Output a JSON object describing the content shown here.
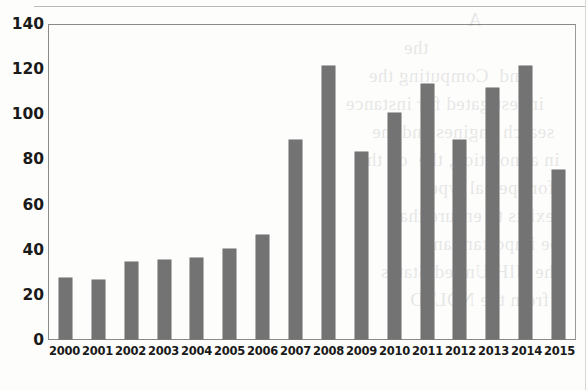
{
  "chart_data": {
    "type": "bar",
    "title": "",
    "xlabel": "",
    "ylabel": "",
    "categories": [
      "2000",
      "2001",
      "2002",
      "2003",
      "2004",
      "2005",
      "2006",
      "2007",
      "2008",
      "2009",
      "2010",
      "2011",
      "2012",
      "2013",
      "2014",
      "2015"
    ],
    "values": [
      27,
      26,
      34,
      35,
      36,
      40,
      46,
      88,
      121,
      83,
      100,
      113,
      88,
      111,
      121,
      75
    ],
    "ylim": [
      0,
      140
    ],
    "yticks": [
      0,
      20,
      40,
      60,
      80,
      100,
      120,
      140
    ],
    "ytick_labels": [
      "0",
      "20",
      "40",
      "60",
      "80",
      "100",
      "120",
      "140"
    ],
    "grid": false,
    "legend": null,
    "bar_color": "#737373",
    "axis_color": "#8a8a8a",
    "series": [
      {
        "name": "count",
        "values": [
          27,
          26,
          34,
          35,
          36,
          40,
          46,
          88,
          121,
          83,
          100,
          113,
          88,
          111,
          121,
          75
        ]
      }
    ]
  },
  "page": {
    "background": "#fdfdfc",
    "bleed_text": "                 A\n                           the\n        and  Computing the\n     investigated for instance\n   search engines and the\n  in annotation, the  on the\n   for special type\n   exists to ensure that\n  be important and\n  the NIH United States\n    from the NDLTD"
  }
}
